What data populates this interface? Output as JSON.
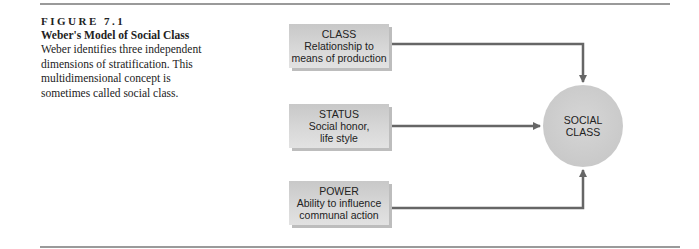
{
  "figure": {
    "label": "FIGURE 7.1",
    "title": "Weber's Model of Social Class",
    "description": "Weber identifies three independent dimensions of stratification. This multidimensional concept is sometimes called social class."
  },
  "diagram": {
    "boxes": [
      {
        "heading": "CLASS",
        "line1": "Relationship to",
        "line2": "means of production"
      },
      {
        "heading": "STATUS",
        "line1": "Social honor,",
        "line2": "life style"
      },
      {
        "heading": "POWER",
        "line1": "Ability to influence",
        "line2": "communal action"
      }
    ],
    "target": {
      "line1": "SOCIAL",
      "line2": "CLASS"
    },
    "colors": {
      "box": "#d4d4d4",
      "circle": "#cccccc",
      "arrow": "#666666",
      "rule": "#9a9a9a"
    }
  }
}
